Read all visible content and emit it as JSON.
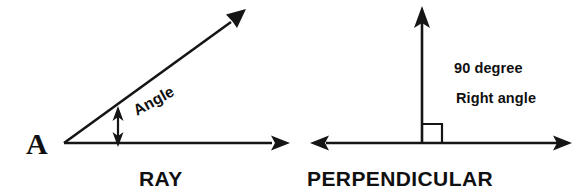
{
  "figure": {
    "background_color": "#ffffff",
    "ink_color": "#151515"
  },
  "ray_diagram": {
    "vertex_label": "A",
    "angle_label": "Angle",
    "caption": "RAY",
    "angle_degrees_estimate": 36,
    "geometry": {
      "vertex": [
        64,
        143
      ],
      "horizontal_ray_end": [
        285,
        143
      ],
      "slanted_ray_end": [
        242,
        14
      ],
      "angle_marker_x": 118,
      "angle_marker_top_y": 110,
      "angle_marker_bottom_y": 143
    }
  },
  "perpendicular_diagram": {
    "note_line_1": "90 degree",
    "note_line_2": "Right angle",
    "caption": "PERPENDICULAR",
    "right_angle_degrees": 90,
    "geometry": {
      "intersection": [
        422,
        143
      ],
      "horizontal_left_end": [
        312,
        143
      ],
      "horizontal_right_end": [
        570,
        143
      ],
      "vertical_top_end": [
        422,
        8
      ],
      "square_marker_size": 20
    }
  }
}
